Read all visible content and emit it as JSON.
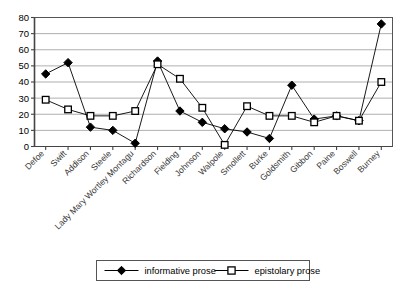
{
  "chart_data": {
    "type": "line",
    "title": "",
    "subtitle": "",
    "xlabel": "",
    "ylabel": "",
    "ylim": [
      0,
      80
    ],
    "ytick_labels": [
      "0",
      "10",
      "20",
      "30",
      "40",
      "50",
      "60",
      "70",
      "80"
    ],
    "ytick_values": [
      0,
      10,
      20,
      30,
      40,
      50,
      60,
      70,
      80
    ],
    "grid": true,
    "grid_axis": "y",
    "legend_position": "bottom",
    "categories": [
      "Defoe",
      "Swift",
      "Addison",
      "Steele",
      "Lady Mary Wortley Montagu",
      "Richardson",
      "Fielding",
      "Johnson",
      "Walpole",
      "Smollett",
      "Burke",
      "Goldsmith",
      "Gibbon",
      "Paine",
      "Boswell",
      "Burney"
    ],
    "series": [
      {
        "name": "informative prose",
        "marker": "filled-diamond",
        "color": "#000000",
        "values": [
          45,
          52,
          12,
          10,
          2,
          53,
          22,
          15,
          11,
          9,
          5,
          38,
          17,
          19,
          16,
          76
        ]
      },
      {
        "name": "epistolary prose",
        "marker": "open-square",
        "color": "#000000",
        "values": [
          29,
          23,
          19,
          19,
          22,
          51,
          42,
          24,
          1,
          25,
          19,
          19,
          15,
          19,
          16,
          40
        ]
      }
    ]
  },
  "legend": {
    "entries": [
      {
        "label": "informative prose"
      },
      {
        "label": "epistolary prose"
      }
    ]
  }
}
